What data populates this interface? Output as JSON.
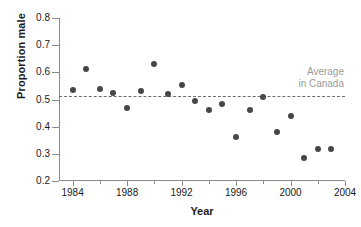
{
  "chart_data": {
    "type": "scatter",
    "title": "",
    "xlabel": "Year",
    "ylabel": "Proportion male",
    "xlim": [
      1983,
      2004
    ],
    "ylim": [
      0.2,
      0.8
    ],
    "grid": false,
    "legend_position": "none",
    "marker_color": "#474747",
    "axis_color": "#8a8a8a",
    "annotation_color": "#9a9a9a",
    "yticks": [
      0.2,
      0.3,
      0.4,
      0.5,
      0.6,
      0.7,
      0.8
    ],
    "ytick_labels": [
      "0.2",
      "0.3",
      "0.4",
      "0.5",
      "0.6",
      "0.7",
      "0.8"
    ],
    "xticks": [
      1984,
      1986,
      1988,
      1990,
      1992,
      1994,
      1996,
      1998,
      2000,
      2002,
      2004
    ],
    "xtick_labels_major": [
      "1984",
      "1988",
      "1992",
      "1996",
      "2000",
      "2004"
    ],
    "xticks_major": [
      1984,
      1988,
      1992,
      1996,
      2000,
      2004
    ],
    "x": [
      1984,
      1985,
      1986,
      1987,
      1988,
      1989,
      1990,
      1991,
      1992,
      1993,
      1994,
      1995,
      1996,
      1997,
      1998,
      1999,
      2000,
      2001,
      2002,
      2003
    ],
    "values": [
      0.535,
      0.612,
      0.54,
      0.524,
      0.468,
      0.531,
      0.63,
      0.521,
      0.554,
      0.496,
      0.462,
      0.484,
      0.361,
      0.463,
      0.508,
      0.38,
      0.44,
      0.283,
      0.317,
      0.317
    ],
    "annotations": [
      {
        "name": "average-in-canada",
        "line1": "Average",
        "line2": "in Canada",
        "type": "hline",
        "y": 0.512
      }
    ]
  }
}
